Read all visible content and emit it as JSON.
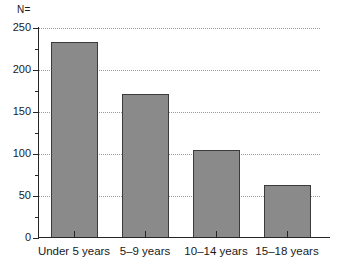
{
  "chart_data": {
    "type": "bar",
    "title": "",
    "subtitle": "",
    "xlabel": "",
    "ylabel": "",
    "n_caption": "N=",
    "categories": [
      "Under 5 years",
      "5–9 years",
      "10–14 years",
      "15–18 years"
    ],
    "values": [
      233,
      172,
      105,
      63
    ],
    "ylim": [
      0,
      250
    ],
    "ytick_labels": [
      "0",
      "50",
      "100",
      "150",
      "200",
      "250"
    ],
    "ytick_values": [
      0,
      50,
      100,
      150,
      200,
      250
    ],
    "yminor_tick_values": [
      25,
      75,
      125,
      175,
      225
    ],
    "grid": "horizontal-dotted",
    "legend": "none",
    "bar_color": "#8a8a8a",
    "bar_edge_color": "#3b3b3b",
    "axis_color": "#262626",
    "gridline_color": "#9a9a9a",
    "background": "#ffffff"
  }
}
